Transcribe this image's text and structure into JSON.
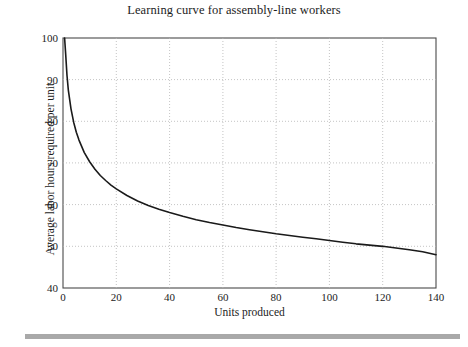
{
  "figure": {
    "title": "Learning curve for assembly-line workers",
    "footer_bar_color": "#a9a9a9",
    "background_color": "#ffffff"
  },
  "chart_data": {
    "type": "line",
    "title": "Learning curve for assembly-line workers",
    "xlabel": "Units produced",
    "ylabel": "Average labor hours required per unit",
    "xlim": [
      0,
      140
    ],
    "ylim": [
      40,
      100
    ],
    "grid": true,
    "grid_style": "dotted",
    "grid_color": "#b5b5b5",
    "legend": "none",
    "line_color": "#1a1a1a",
    "line_width": 1.6,
    "xticks": [
      0,
      20,
      40,
      60,
      80,
      100,
      120,
      140
    ],
    "xtick_labels": [
      "0",
      "20",
      "40",
      "60",
      "80",
      "100",
      "120",
      "140"
    ],
    "yticks": [
      40,
      50,
      60,
      70,
      80,
      90,
      100
    ],
    "ytick_labels": [
      "40",
      "50",
      "60",
      "70",
      "80",
      "90",
      "100"
    ],
    "series": [
      {
        "name": "Average labor hours per unit",
        "x": [
          0.6,
          1,
          1.5,
          2,
          3,
          4,
          5,
          6,
          8,
          10,
          12,
          14,
          16,
          18,
          20,
          24,
          28,
          32,
          36,
          40,
          45,
          50,
          55,
          60,
          65,
          70,
          75,
          80,
          85,
          90,
          95,
          100,
          105,
          110,
          115,
          120,
          125,
          130,
          135,
          140
        ],
        "y": [
          100.0,
          96.2,
          91.0,
          87.5,
          83.0,
          79.8,
          77.4,
          75.5,
          72.5,
          70.3,
          68.5,
          67.0,
          65.8,
          64.7,
          63.8,
          62.2,
          60.9,
          59.8,
          58.9,
          58.1,
          57.2,
          56.4,
          55.7,
          55.1,
          54.5,
          54.0,
          53.5,
          53.0,
          52.6,
          52.2,
          51.8,
          51.4,
          51.0,
          50.6,
          50.3,
          50.0,
          49.6,
          49.2,
          48.7,
          48.0
        ]
      }
    ],
    "annotations": []
  },
  "axes": {
    "y_title": "Average labor hours required per unit",
    "x_title": "Units produced",
    "y_ticks": [
      {
        "value": 100,
        "label": "100"
      },
      {
        "value": 90,
        "label": "90"
      },
      {
        "value": 80,
        "label": "80"
      },
      {
        "value": 70,
        "label": "70"
      },
      {
        "value": 60,
        "label": "60"
      },
      {
        "value": 50,
        "label": "50"
      },
      {
        "value": 40,
        "label": "40"
      }
    ],
    "x_ticks": [
      {
        "value": 0,
        "label": "0"
      },
      {
        "value": 20,
        "label": "20"
      },
      {
        "value": 40,
        "label": "40"
      },
      {
        "value": 60,
        "label": "60"
      },
      {
        "value": 80,
        "label": "80"
      },
      {
        "value": 100,
        "label": "100"
      },
      {
        "value": 120,
        "label": "120"
      },
      {
        "value": 140,
        "label": "140"
      }
    ]
  }
}
